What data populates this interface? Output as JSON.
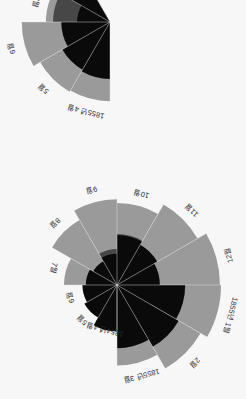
{
  "figure": {
    "background_color": "#f7f7f7",
    "title": "",
    "label_color": "#2b2b2b"
  },
  "palette": {
    "light_gray": "#9a9a9a",
    "dark_gray": "#474747",
    "black": "#0a0a0a",
    "divider": "#e8e8e8"
  },
  "chart_data": {
    "type": "pie",
    "chart_variant": "polar-area-coxcomb",
    "title": "",
    "subtitle": "",
    "xlabel": "",
    "ylabel": "",
    "grid": false,
    "legend_position": "none",
    "rotation_deg": 180,
    "series": [
      {
        "name": "light-gray-outer",
        "color": "#9a9a9a"
      },
      {
        "name": "dark-gray-middle",
        "color": "#474747"
      },
      {
        "name": "black-inner",
        "color": "#0a0a0a"
      }
    ],
    "panels": [
      {
        "panel_id": "top-rose",
        "center_px": [
          129,
          114
        ],
        "start_angle_deg": 90,
        "categories": [
          "1854년 4월",
          "5월",
          "6월",
          "7월",
          "8월",
          "9월",
          "10월",
          "11월",
          "12월",
          "1855년 1월",
          "2월",
          "1855년 3월"
        ],
        "tick_labels": [
          "1854년 4월",
          "5월",
          "6월",
          "7월",
          "8월",
          "9월",
          "10월",
          "11월",
          "12월",
          "1855년 1월",
          "2월",
          "1855년 3월"
        ],
        "values": {
          "light_gray_outer": [
            10,
            12,
            11,
            26,
            52,
            68,
            62,
            80,
            98,
            100,
            86,
            60
          ],
          "dark_gray_middle": [
            17,
            13,
            8,
            6,
            5,
            12,
            24,
            17,
            14,
            14,
            13,
            11
          ],
          "black_inner": [
            20,
            13,
            11,
            9,
            7,
            9,
            23,
            20,
            17,
            43,
            47,
            37
          ]
        },
        "rlim": [
          0,
          100
        ]
      },
      {
        "panel_id": "bottom-rose",
        "center_px": [
          136,
          377
        ],
        "start_angle_deg": 90,
        "categories": [
          "1855년 4월",
          "5월",
          "6월",
          "7월",
          "8월"
        ],
        "tick_labels": [
          "1855년 4월",
          "5월",
          "6월",
          "7월",
          "8월"
        ],
        "values": {
          "light_gray_outer": [
            58,
            60,
            72,
            38,
            48
          ],
          "dark_gray_middle": [
            12,
            10,
            9,
            30,
            22
          ],
          "black_inner": [
            30,
            28,
            22,
            10,
            18
          ]
        },
        "rlim": [
          0,
          100
        ]
      }
    ]
  },
  "labels": {
    "top": [
      {
        "id": "top-m04",
        "text": "1854년 4월"
      },
      {
        "id": "top-m05",
        "text": "5월"
      },
      {
        "id": "top-m06",
        "text": "6월"
      },
      {
        "id": "top-m07",
        "text": "7월"
      },
      {
        "id": "top-m08",
        "text": "8월"
      },
      {
        "id": "top-m09",
        "text": "9월"
      },
      {
        "id": "top-m10",
        "text": "10월"
      },
      {
        "id": "top-m11",
        "text": "11월"
      },
      {
        "id": "top-m12",
        "text": "12월"
      },
      {
        "id": "top-m01",
        "text": "1855년 1월"
      },
      {
        "id": "top-m02",
        "text": "2월"
      },
      {
        "id": "top-m03",
        "text": "1855년 3월"
      }
    ],
    "bottom": [
      {
        "id": "bot-m04",
        "text": "1855년 4월"
      },
      {
        "id": "bot-m05",
        "text": "5월"
      },
      {
        "id": "bot-m06",
        "text": "6월"
      },
      {
        "id": "bot-m07",
        "text": "7월"
      },
      {
        "id": "bot-m08",
        "text": "8월"
      }
    ]
  }
}
